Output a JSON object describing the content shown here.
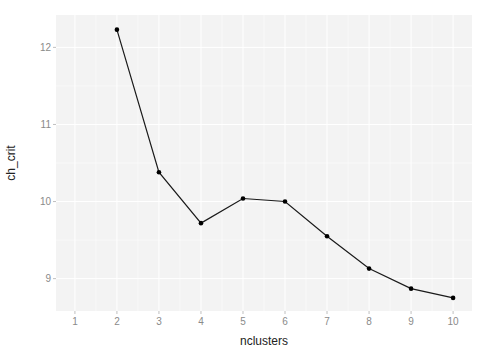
{
  "chart_data": {
    "type": "line",
    "title": "",
    "xlabel": "nclusters",
    "ylabel": "ch_crit",
    "x": [
      2,
      3,
      4,
      5,
      6,
      7,
      8,
      9,
      10
    ],
    "series": [
      {
        "name": "ch_crit",
        "values": [
          12.23,
          10.38,
          9.72,
          10.04,
          10.0,
          9.55,
          9.13,
          8.87,
          8.75
        ]
      }
    ],
    "xticks": [
      1,
      2,
      3,
      4,
      5,
      6,
      7,
      8,
      9,
      10
    ],
    "yticks": [
      9,
      10,
      11,
      12
    ],
    "xlim": [
      0.55,
      10.45
    ],
    "ylim": [
      8.58,
      12.42
    ],
    "grid": true,
    "legend": null,
    "colors": {
      "panel_background": "#f3f3f3",
      "grid": "#ffffff",
      "line": "#1a1a1a",
      "points": "#000000",
      "tick_text": "#8a8a8a",
      "axis_title": "#222222"
    }
  }
}
